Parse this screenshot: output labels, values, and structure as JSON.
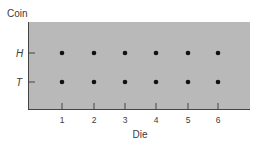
{
  "chart_data": {
    "type": "scatter",
    "title": "",
    "xlabel": "Die",
    "ylabel": "Coin",
    "x_categories": [
      "1",
      "2",
      "3",
      "4",
      "5",
      "6"
    ],
    "y_categories": [
      "T",
      "H"
    ],
    "points": [
      {
        "x": "1",
        "y": "H"
      },
      {
        "x": "2",
        "y": "H"
      },
      {
        "x": "3",
        "y": "H"
      },
      {
        "x": "4",
        "y": "H"
      },
      {
        "x": "5",
        "y": "H"
      },
      {
        "x": "6",
        "y": "H"
      },
      {
        "x": "1",
        "y": "T"
      },
      {
        "x": "2",
        "y": "T"
      },
      {
        "x": "3",
        "y": "T"
      },
      {
        "x": "4",
        "y": "T"
      },
      {
        "x": "5",
        "y": "T"
      },
      {
        "x": "6",
        "y": "T"
      }
    ],
    "grid": false,
    "legend": null,
    "colors": {
      "plot_background": "#b9b9b9",
      "point": "#111111",
      "axis": "#444444"
    }
  }
}
